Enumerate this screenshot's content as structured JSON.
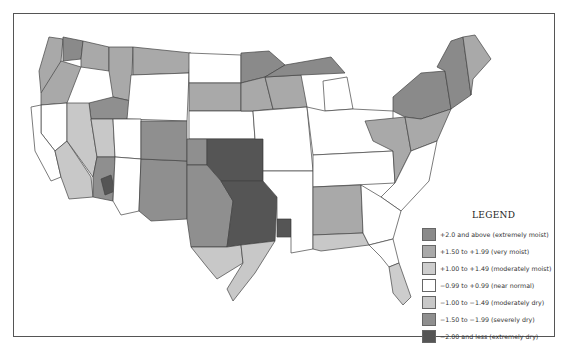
{
  "legend": {
    "title": "LEGEND",
    "items": [
      {
        "key": "em",
        "label": "+2.0 and above (extremely moist)",
        "color": "#8a8a8a"
      },
      {
        "key": "vm",
        "label": "+1.50 to +1.99 (very moist)",
        "color": "#a9a9a9"
      },
      {
        "key": "mm",
        "label": "+1.00 to +1.49 (moderately moist)",
        "color": "#cdcdcd"
      },
      {
        "key": "nn",
        "label": "−0.99 to +0.99 (near normal)",
        "color": "#ffffff"
      },
      {
        "key": "md",
        "label": "−1.00 to −1.49 (moderately dry)",
        "color": "#c8c8c8"
      },
      {
        "key": "sd",
        "label": "−1.50 to −1.99 (severely dry)",
        "color": "#8f8f8f"
      },
      {
        "key": "ed",
        "label": "−2.00 and less (extremely dry)",
        "color": "#555555"
      }
    ]
  },
  "map_data": {
    "type": "choropleth",
    "subject": "Contiguous United States by climate division",
    "regions": [
      {
        "name": "pacific-northwest-coast",
        "class": "vm"
      },
      {
        "name": "puget-sound",
        "class": "em"
      },
      {
        "name": "eastern-washington",
        "class": "vm"
      },
      {
        "name": "north-idaho-montana-west",
        "class": "vm"
      },
      {
        "name": "north-montana",
        "class": "vm"
      },
      {
        "name": "oregon-coast",
        "class": "vm"
      },
      {
        "name": "california-north-interior",
        "class": "nn"
      },
      {
        "name": "california-coast",
        "class": "nn"
      },
      {
        "name": "california-south",
        "class": "md"
      },
      {
        "name": "nevada",
        "class": "md"
      },
      {
        "name": "utah-west",
        "class": "md"
      },
      {
        "name": "arizona-west",
        "class": "sd"
      },
      {
        "name": "arizona-central",
        "class": "ed"
      },
      {
        "name": "arizona-south",
        "class": "nn"
      },
      {
        "name": "new-mexico",
        "class": "sd"
      },
      {
        "name": "colorado-south",
        "class": "sd"
      },
      {
        "name": "oklahoma-kansas-core",
        "class": "ed"
      },
      {
        "name": "kansas-west",
        "class": "sd"
      },
      {
        "name": "texas-west",
        "class": "sd"
      },
      {
        "name": "texas-central-east",
        "class": "ed"
      },
      {
        "name": "louisiana-north",
        "class": "ed"
      },
      {
        "name": "texas-south",
        "class": "md"
      },
      {
        "name": "texas-coast",
        "class": "md"
      },
      {
        "name": "north-dakota",
        "class": "nn"
      },
      {
        "name": "south-dakota",
        "class": "vm"
      },
      {
        "name": "nebraska",
        "class": "nn"
      },
      {
        "name": "minnesota-north",
        "class": "em"
      },
      {
        "name": "minnesota-south",
        "class": "vm"
      },
      {
        "name": "wisconsin",
        "class": "vm"
      },
      {
        "name": "michigan-upper",
        "class": "em"
      },
      {
        "name": "michigan-lower",
        "class": "nn"
      },
      {
        "name": "iowa-missouri",
        "class": "nn"
      },
      {
        "name": "illinois-indiana-ohio",
        "class": "nn"
      },
      {
        "name": "kentucky-tennessee",
        "class": "nn"
      },
      {
        "name": "appalachia",
        "class": "vm"
      },
      {
        "name": "pennsylvania-new-york",
        "class": "em"
      },
      {
        "name": "new-england-north",
        "class": "em"
      },
      {
        "name": "maine",
        "class": "vm"
      },
      {
        "name": "mid-atlantic",
        "class": "vm"
      },
      {
        "name": "virginia-carolinas",
        "class": "nn"
      },
      {
        "name": "alabama-mississippi",
        "class": "vm"
      },
      {
        "name": "gulf-coast-panhandle",
        "class": "md"
      },
      {
        "name": "georgia",
        "class": "nn"
      },
      {
        "name": "florida-north",
        "class": "nn"
      },
      {
        "name": "florida-south",
        "class": "mm"
      },
      {
        "name": "arkansas-louisiana",
        "class": "nn"
      },
      {
        "name": "wyoming",
        "class": "nn"
      },
      {
        "name": "idaho-south",
        "class": "sd"
      },
      {
        "name": "utah-east",
        "class": "nn"
      }
    ]
  }
}
